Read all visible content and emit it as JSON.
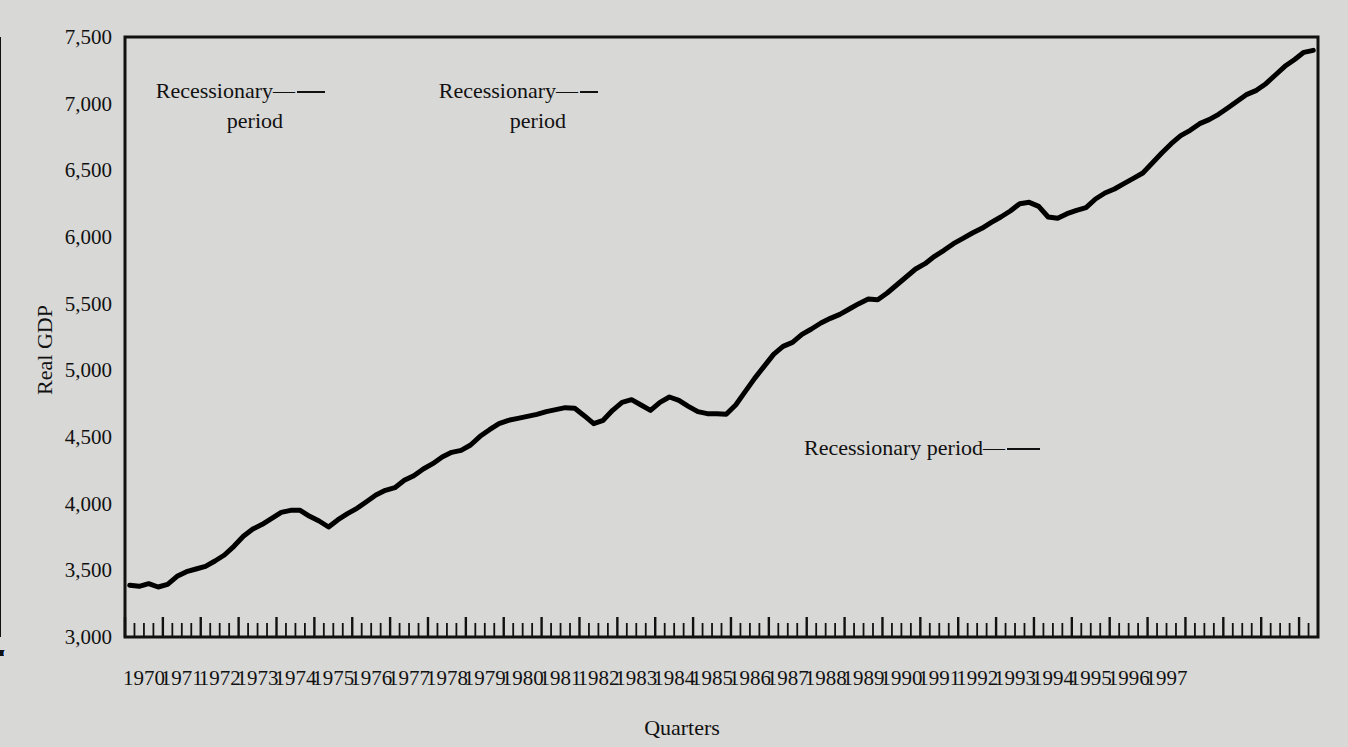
{
  "chart_data": {
    "type": "line",
    "title": "",
    "xlabel": "Quarters",
    "ylabel": "Real GDP",
    "ylim": [
      3000,
      7500
    ],
    "yticks": [
      3000,
      3500,
      4000,
      4500,
      5000,
      5500,
      6000,
      6500,
      7000,
      7500
    ],
    "ytick_labels": [
      "3,000",
      "3,500",
      "4,000",
      "4,500",
      "5,000",
      "5,500",
      "6,000",
      "6,500",
      "7,000",
      "7,500"
    ],
    "grid": false,
    "legend_position": "none",
    "line_color": "#000000",
    "plot_background": "#d8d8d6",
    "recession_band_color": "#9a9a9a",
    "x_categories": [
      "1970",
      "1971",
      "1972",
      "1973",
      "1974",
      "1975",
      "1976",
      "1977",
      "1978",
      "1979",
      "1980",
      "1981",
      "1982",
      "1983",
      "1984",
      "1985",
      "1986",
      "1987",
      "1988",
      "1989",
      "1990",
      "1991",
      "1992",
      "1993",
      "1994",
      "1995",
      "1996",
      "1997"
    ],
    "quarters_per_year": 4,
    "series": [
      {
        "name": "Real GDP",
        "x_start_year": 1970,
        "x_start_quarter": 1,
        "values": [
          3388,
          3380,
          3400,
          3375,
          3395,
          3455,
          3490,
          3510,
          3530,
          3570,
          3615,
          3680,
          3755,
          3810,
          3845,
          3890,
          3935,
          3950,
          3950,
          3905,
          3870,
          3825,
          3880,
          3925,
          3965,
          4015,
          4065,
          4100,
          4120,
          4175,
          4210,
          4260,
          4300,
          4350,
          4385,
          4400,
          4440,
          4505,
          4555,
          4600,
          4625,
          4640,
          4655,
          4670,
          4690,
          4705,
          4720,
          4715,
          4660,
          4600,
          4625,
          4700,
          4760,
          4780,
          4740,
          4700,
          4760,
          4800,
          4775,
          4730,
          4690,
          4675,
          4675,
          4670,
          4740,
          4840,
          4940,
          5030,
          5120,
          5180,
          5210,
          5270,
          5310,
          5355,
          5390,
          5420,
          5460,
          5500,
          5535,
          5530,
          5580,
          5640,
          5700,
          5760,
          5800,
          5855,
          5900,
          5950,
          5990,
          6030,
          6065,
          6110,
          6150,
          6195,
          6250,
          6260,
          6230,
          6150,
          6140,
          6175,
          6200,
          6220,
          6285,
          6330,
          6360,
          6400,
          6440,
          6480,
          6555,
          6630,
          6700,
          6760,
          6800,
          6850,
          6880,
          6920,
          6970,
          7020,
          7070,
          7100,
          7150,
          7215,
          7280,
          7330,
          7385,
          7400
        ]
      }
    ],
    "recessions": [
      {
        "label_line1": "Recessionary",
        "label_line2": "period",
        "start": "1973Q4",
        "end": "1975Q1",
        "quarter_marks": [
          "I",
          "II",
          "III",
          "IV",
          "I",
          "II",
          "III",
          "IV"
        ]
      },
      {
        "label_line1": "Recessionary",
        "label_line2": "period",
        "start": "1979Q4",
        "end": "1982Q4",
        "quarter_marks": [
          "II",
          "III",
          "IV",
          "I",
          "II",
          "III",
          "IV",
          "I",
          "II",
          "III",
          "IV",
          "I"
        ]
      },
      {
        "label_line1": "Recessionary period",
        "label_line2": "",
        "start": "1990Q3",
        "end": "1991Q1",
        "quarter_marks": [
          "III",
          "IV",
          "I"
        ]
      }
    ]
  },
  "annotations": {
    "a1": {
      "line1": "Recessionary",
      "line2": "period"
    },
    "a2": {
      "line1": "Recessionary",
      "line2": "period"
    },
    "a3": {
      "line1": "Recessionary period",
      "line2": ""
    }
  },
  "axes": {
    "y_title": "Real GDP",
    "x_title": "Quarters"
  }
}
